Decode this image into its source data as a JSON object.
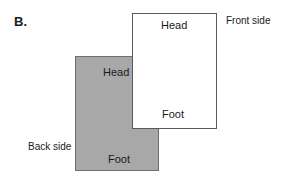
{
  "figure": {
    "panel_label": "B.",
    "front": {
      "side_label": "Front side",
      "top_text": "Head",
      "bottom_text": "Foot",
      "fill": "#ffffff"
    },
    "back": {
      "side_label": "Back side",
      "top_text": "Head",
      "bottom_text": "Foot",
      "fill": "#a8a8a8"
    }
  }
}
